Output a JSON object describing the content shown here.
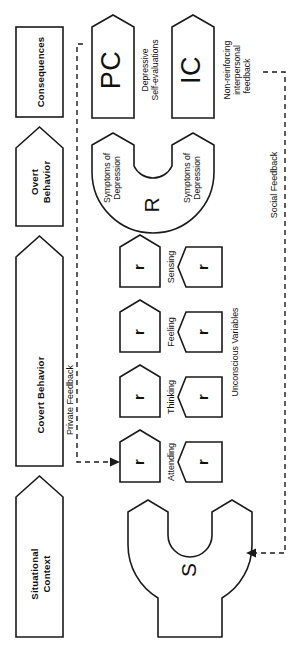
{
  "diagram": {
    "orientation": "rotated-90",
    "colors": {
      "stroke": "#1a1a1a",
      "fill": "#ffffff",
      "text": "#111111"
    },
    "column_headers": [
      {
        "id": "consequences",
        "label": "Consequences",
        "shape": "rectangle"
      },
      {
        "id": "overt-behavior",
        "label": "Overt\nBehavior",
        "line1": "Overt",
        "line2": "Behavior",
        "shape": "pentagon"
      },
      {
        "id": "covert-behavior",
        "label": "Covert Behavior",
        "shape": "pentagon"
      },
      {
        "id": "situational-context",
        "label": "Situational\nContext",
        "line1": "Situational",
        "line2": "Context",
        "shape": "pentagon"
      }
    ],
    "consequence_nodes": [
      {
        "id": "pc",
        "label": "PC",
        "caption_line1": "Depressive",
        "caption_line2": "Self-evaluations"
      },
      {
        "id": "ic",
        "label": "IC",
        "caption_line1": "Non-reinforcing",
        "caption_line2": "interpersonal",
        "caption_line3": "feedback"
      }
    ],
    "response_node": {
      "id": "r",
      "label": "R",
      "arm_top_label_line1": "Symptoms of",
      "arm_top_label_line2": "Depression",
      "arm_bottom_label_line1": "Symptoms of",
      "arm_bottom_label_line2": "Depression"
    },
    "covert_rows": [
      {
        "id": "sensing",
        "label": "Sensing",
        "overt_symbol": "r",
        "unconscious_symbol": "r"
      },
      {
        "id": "feeling",
        "label": "Feeling",
        "overt_symbol": "r",
        "unconscious_symbol": "r"
      },
      {
        "id": "thinking",
        "label": "Thinking",
        "overt_symbol": "r",
        "unconscious_symbol": "r"
      },
      {
        "id": "attending",
        "label": "Attending",
        "overt_symbol": "r",
        "unconscious_symbol": "r"
      }
    ],
    "unconscious_group_label": "Unconscious Variables",
    "stimulus_node": {
      "id": "s",
      "label": "S"
    },
    "feedback_loops": [
      {
        "id": "private-feedback",
        "label": "Private Feedback",
        "from": "pc",
        "to": "attending",
        "style": "dashed-arrow"
      },
      {
        "id": "social-feedback",
        "label": "Social Feedback",
        "from": "ic",
        "to": "s",
        "style": "dashed-arrow"
      }
    ]
  }
}
